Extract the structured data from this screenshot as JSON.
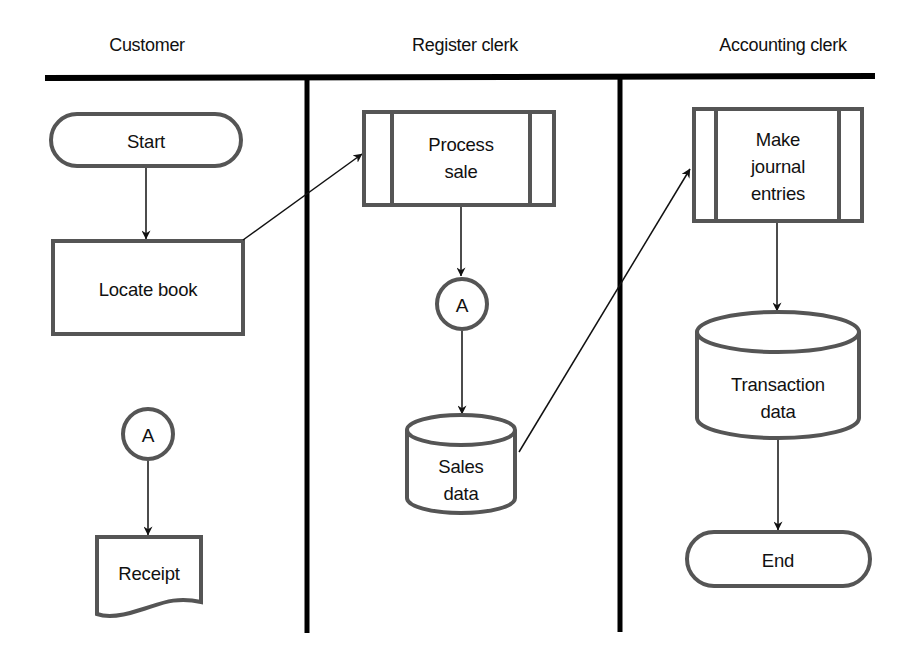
{
  "diagram": {
    "type": "swimlane-flowchart",
    "colors": {
      "shape_stroke": "#555555",
      "lane_rule": "#000000",
      "connector_line": "#111111",
      "text": "#111111",
      "background": "#ffffff"
    },
    "lanes": [
      {
        "id": "customer",
        "title": "Customer"
      },
      {
        "id": "register-clerk",
        "title": "Register clerk"
      },
      {
        "id": "accounting-clerk",
        "title": "Accounting clerk"
      }
    ],
    "nodes": {
      "start": {
        "lane": "customer",
        "shape": "terminator",
        "label": "Start"
      },
      "locate_book": {
        "lane": "customer",
        "shape": "process",
        "label": "Locate book"
      },
      "connector_a_customer": {
        "lane": "customer",
        "shape": "on-page-connector",
        "label": "A"
      },
      "receipt": {
        "lane": "customer",
        "shape": "document",
        "label": "Receipt"
      },
      "process_sale": {
        "lane": "register-clerk",
        "shape": "predefined-process",
        "label": "Process\nsale"
      },
      "connector_a_register": {
        "lane": "register-clerk",
        "shape": "on-page-connector",
        "label": "A"
      },
      "sales_data": {
        "lane": "register-clerk",
        "shape": "data-store",
        "label": "Sales\ndata"
      },
      "make_journal_entries": {
        "lane": "accounting-clerk",
        "shape": "predefined-process",
        "label": "Make\njournal\nentries"
      },
      "transaction_data": {
        "lane": "accounting-clerk",
        "shape": "data-store",
        "label": "Transaction\ndata"
      },
      "end": {
        "lane": "accounting-clerk",
        "shape": "terminator",
        "label": "End"
      }
    },
    "edges": [
      {
        "from": "Start",
        "to": "Locate book"
      },
      {
        "from": "Locate book",
        "to": "Process sale"
      },
      {
        "from": "Process sale",
        "to": "A"
      },
      {
        "from": "A",
        "to": "Sales data"
      },
      {
        "from": "Sales data",
        "to": "Make journal entries"
      },
      {
        "from": "Make journal entries",
        "to": "Transaction data"
      },
      {
        "from": "Transaction data",
        "to": "End"
      },
      {
        "from": "A",
        "to": "Receipt"
      }
    ]
  }
}
